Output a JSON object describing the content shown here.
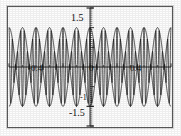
{
  "figure": {
    "title": "",
    "frame_color": "#5a5a5a",
    "background": "#ffffff",
    "curve_color": "#1a1a1a"
  },
  "labels": {
    "y_top": "1.5",
    "y_bottom": "-1.5",
    "y_minus_one": "-1",
    "x_left": "-0.4",
    "x_zero": "0",
    "x_right": "0.4"
  },
  "chart_data": {
    "type": "line",
    "title": "",
    "xlabel": "",
    "ylabel": "",
    "xlim": [
      -0.6,
      0.6
    ],
    "ylim": [
      -1.5,
      1.5
    ],
    "grid": false,
    "legend": false,
    "y_ticks": [
      -1.5,
      -1,
      1.5
    ],
    "y_ticklabels": [
      "-1.5",
      "-1",
      "1.5"
    ],
    "x_ticks": [
      -0.4,
      0,
      0.4
    ],
    "x_ticklabels": [
      "-0.4",
      "0",
      "0.4"
    ],
    "series": [
      {
        "name": "beat-signal",
        "formula": "cos(2*pi*f_c*x) * cos(2*pi*f_m*x)",
        "carrier_frequency": 40,
        "modulation_frequency": 5,
        "amplitude": 1.0
      },
      {
        "name": "envelope-upper",
        "formula": "+cos(2*pi*f_m*x)",
        "amplitude": 1.0
      },
      {
        "name": "envelope-lower",
        "formula": "-cos(2*pi*f_m*x)",
        "amplitude": 1.0
      }
    ],
    "envelope_lobe_centers": [
      -0.4,
      0.0,
      0.4
    ],
    "envelope_nodes": [
      -0.6,
      -0.2,
      0.2,
      0.6
    ],
    "peak_value": 1.0,
    "trough_value": -1.0
  }
}
